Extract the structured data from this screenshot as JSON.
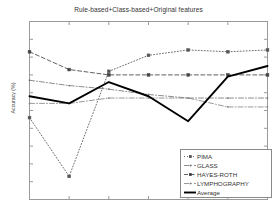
{
  "chart_data": {
    "type": "line",
    "title": "Rule-based+Class-based+Original features",
    "xlabel": "",
    "ylabel": "Accuracy (%)",
    "x": [
      1,
      2,
      3,
      4,
      5,
      6,
      7
    ],
    "xlim": [
      1,
      7
    ],
    "ylim": [
      0,
      100
    ],
    "grid": false,
    "legend_position": "lower right",
    "xtick_labels": [],
    "ytick_labels": [],
    "series": [
      {
        "name": "PIMA",
        "style": "dotted",
        "marker": "square",
        "color": "#555555",
        "values": [
          46,
          13,
          72,
          81,
          84,
          83,
          84
        ]
      },
      {
        "name": "GLASS",
        "style": "dash-dot",
        "marker": "dot",
        "color": "#777777",
        "values": [
          67,
          64,
          62,
          59,
          57,
          57,
          57
        ]
      },
      {
        "name": "HAYES-ROTH",
        "style": "dashed",
        "marker": "square",
        "color": "#444444",
        "values": [
          83,
          73,
          70,
          70,
          70,
          70,
          70
        ]
      },
      {
        "name": "LYMPHOGRAPHY",
        "style": "dash-dot",
        "marker": "dot",
        "color": "#888888",
        "values": [
          54,
          54,
          57,
          57,
          57,
          52,
          52
        ]
      },
      {
        "name": "Average",
        "style": "solid-thick",
        "marker": "none",
        "color": "#000000",
        "values": [
          58,
          54,
          66,
          58,
          44,
          69,
          75
        ]
      }
    ]
  },
  "legend": {
    "items": [
      {
        "label": "PIMA",
        "swatch": "dotted-square-marker"
      },
      {
        "label": "GLASS",
        "swatch": "dashdot-line"
      },
      {
        "label": "HAYES-ROTH",
        "swatch": "dashed-square-marker"
      },
      {
        "label": "LYMPHOGRAPHY",
        "swatch": "dashdot-line"
      },
      {
        "label": "Average",
        "swatch": "solid-thick-line"
      }
    ]
  }
}
